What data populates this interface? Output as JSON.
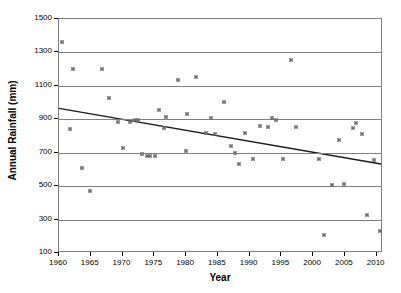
{
  "chart_data": {
    "type": "scatter",
    "title": "",
    "xlabel": "Year",
    "ylabel": "Annual Rainfall (mm)",
    "xlim": [
      1960,
      2011
    ],
    "ylim": [
      100,
      1500
    ],
    "grid": true,
    "legend": false,
    "x_ticks": [
      1960,
      1965,
      1970,
      1975,
      1980,
      1985,
      1990,
      1995,
      2000,
      2005,
      2010
    ],
    "y_ticks": [
      100,
      300,
      500,
      700,
      900,
      1100,
      1300,
      1500
    ],
    "marker_color": "#6e6e6e",
    "gridline_color": "#808080",
    "frame_color": "#808080",
    "series": [
      {
        "name": "Annual Rainfall",
        "marker": "diamond-plus",
        "points": [
          {
            "x": 1960.4,
            "y": 1360
          },
          {
            "x": 1961.8,
            "y": 840
          },
          {
            "x": 1962.2,
            "y": 1200
          },
          {
            "x": 1963.6,
            "y": 610
          },
          {
            "x": 1964.9,
            "y": 470
          },
          {
            "x": 1966.7,
            "y": 1200
          },
          {
            "x": 1967.9,
            "y": 1030
          },
          {
            "x": 1969.3,
            "y": 885
          },
          {
            "x": 1970.0,
            "y": 730
          },
          {
            "x": 1971.1,
            "y": 885
          },
          {
            "x": 1971.9,
            "y": 895
          },
          {
            "x": 1972.4,
            "y": 895
          },
          {
            "x": 1973.1,
            "y": 695
          },
          {
            "x": 1973.9,
            "y": 680
          },
          {
            "x": 1974.4,
            "y": 680
          },
          {
            "x": 1975.1,
            "y": 680
          },
          {
            "x": 1975.8,
            "y": 955
          },
          {
            "x": 1976.6,
            "y": 845
          },
          {
            "x": 1976.9,
            "y": 915
          },
          {
            "x": 1978.8,
            "y": 1135
          },
          {
            "x": 1980.0,
            "y": 710
          },
          {
            "x": 1980.2,
            "y": 930
          },
          {
            "x": 1981.6,
            "y": 1155
          },
          {
            "x": 1983.1,
            "y": 820
          },
          {
            "x": 1983.9,
            "y": 905
          },
          {
            "x": 1984.6,
            "y": 810
          },
          {
            "x": 1985.9,
            "y": 1005
          },
          {
            "x": 1987.0,
            "y": 740
          },
          {
            "x": 1987.7,
            "y": 698
          },
          {
            "x": 1988.4,
            "y": 630
          },
          {
            "x": 1989.3,
            "y": 820
          },
          {
            "x": 1990.5,
            "y": 660
          },
          {
            "x": 1991.7,
            "y": 860
          },
          {
            "x": 1992.9,
            "y": 855
          },
          {
            "x": 1993.6,
            "y": 905
          },
          {
            "x": 1994.1,
            "y": 895
          },
          {
            "x": 1995.2,
            "y": 660
          },
          {
            "x": 1996.5,
            "y": 1255
          },
          {
            "x": 1997.3,
            "y": 855
          },
          {
            "x": 2001.0,
            "y": 660
          },
          {
            "x": 2001.7,
            "y": 205
          },
          {
            "x": 2002.9,
            "y": 505
          },
          {
            "x": 2004.0,
            "y": 775
          },
          {
            "x": 2004.9,
            "y": 510
          },
          {
            "x": 2006.2,
            "y": 850
          },
          {
            "x": 2006.8,
            "y": 875
          },
          {
            "x": 2007.7,
            "y": 810
          },
          {
            "x": 2008.5,
            "y": 330
          },
          {
            "x": 2009.6,
            "y": 655
          },
          {
            "x": 2010.6,
            "y": 230
          }
        ]
      }
    ],
    "trendline": {
      "type": "linear",
      "x_start": 1960,
      "y_start": 960,
      "x_end": 2011,
      "y_end": 625,
      "color": "#1a1a1a"
    }
  }
}
